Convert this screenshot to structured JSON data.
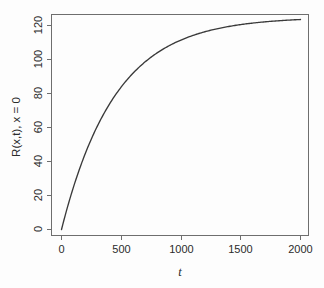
{
  "chart_data": {
    "type": "line",
    "title": "",
    "subtitle": "",
    "xlabel": "t",
    "ylabel": "R(x,t), x = 0",
    "xlim": [
      0,
      2000
    ],
    "ylim": [
      0,
      127
    ],
    "xticks": [
      0,
      500,
      1000,
      1500,
      2000
    ],
    "yticks": [
      0,
      20,
      40,
      60,
      80,
      100,
      120
    ],
    "xtick_labels": [
      "0",
      "500",
      "1000",
      "1500",
      "2000"
    ],
    "ytick_labels": [
      "0",
      "20",
      "40",
      "60",
      "80",
      "100",
      "120"
    ],
    "grid": false,
    "legend": null,
    "legend_position": "none",
    "annotations": [],
    "series": [
      {
        "name": "R(x,t) at x = 0",
        "color": "#3a3a3a",
        "x": [
          0,
          25,
          50,
          75,
          100,
          125,
          150,
          175,
          200,
          250,
          300,
          350,
          400,
          450,
          500,
          550,
          600,
          650,
          700,
          750,
          800,
          850,
          900,
          950,
          1000,
          1100,
          1200,
          1300,
          1400,
          1500,
          1600,
          1700,
          1800,
          1900,
          2000
        ],
        "y": [
          0.0,
          6.8,
          13.1,
          19.1,
          24.7,
          30.0,
          35.0,
          39.7,
          44.1,
          52.2,
          59.3,
          65.6,
          71.2,
          76.1,
          80.5,
          84.4,
          87.8,
          90.9,
          93.6,
          96.1,
          98.2,
          100.1,
          101.9,
          103.4,
          104.8,
          107.1,
          108.9,
          110.4,
          111.6,
          112.5,
          113.2,
          113.8,
          114.3,
          114.6,
          114.9
        ]
      }
    ],
    "model": {
      "form": "R(t) = A * (1 - exp(-t / tau))",
      "A": 125,
      "tau": 450,
      "asymptote": 125
    }
  },
  "axes": {
    "x_axis_name": "t-axis",
    "y_axis_name": "R-axis"
  }
}
